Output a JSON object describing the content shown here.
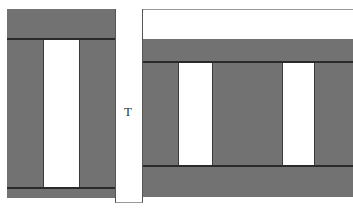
{
  "diagram": {
    "top_caption": "",
    "center_label": "T",
    "colors": {
      "fill": "#727272",
      "background": "#ffffff",
      "stroke": "#2a2a2a"
    },
    "left_block": {
      "description": "gray frame with one white vertical slot"
    },
    "right_block": {
      "description": "gray frame with two white vertical slots under white top band"
    }
  }
}
